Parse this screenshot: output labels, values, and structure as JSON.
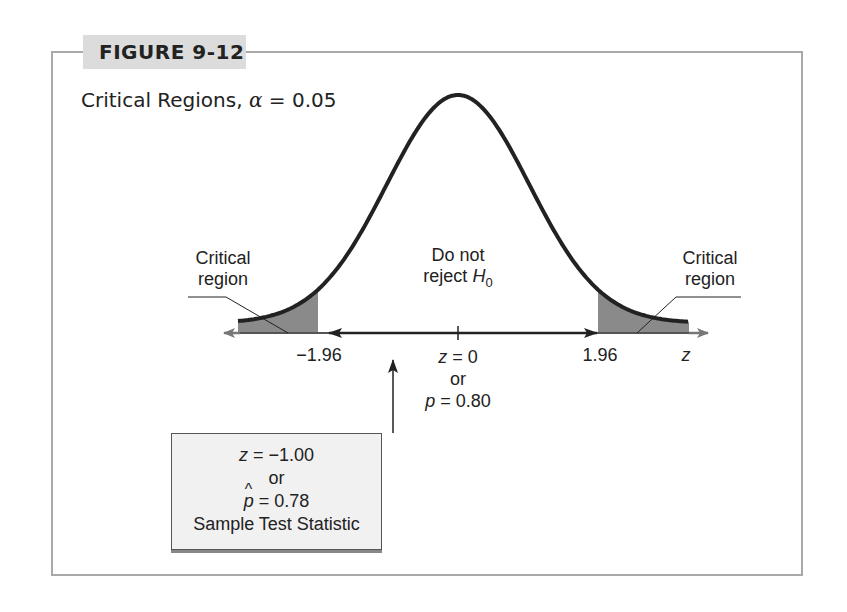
{
  "figure": {
    "label": "FIGURE 9-12",
    "subtitle_prefix": "Critical Regions, ",
    "alpha_symbol": "α",
    "alpha_value": " = 0.05"
  },
  "labels": {
    "left_region_line1": "Critical",
    "left_region_line2": "region",
    "right_region_line1": "Critical",
    "right_region_line2": "region",
    "center_line1": "Do not",
    "center_line2_prefix": "reject ",
    "center_h": "H",
    "center_sub": "0",
    "left_critical": "−1.96",
    "right_critical": "1.96",
    "axis_var": "z",
    "center_z_var": "z",
    "center_z_val": " = 0",
    "center_or": "or",
    "center_p_var": "p",
    "center_p_val": " = 0.80"
  },
  "stat_box": {
    "z_var": "z",
    "z_val": " = −1.00",
    "or": "or",
    "phat_var": "p",
    "phat_val": " = 0.78",
    "caption": "Sample Test Statistic"
  },
  "colors": {
    "frame": "#a9a9a9",
    "label_bg": "#dcdcdc",
    "shade": "#8a8a8a",
    "curve": "#222222",
    "box_bg": "#f1f1f1"
  },
  "chart_data": {
    "type": "area",
    "title": "Critical Regions, α = 0.05",
    "distribution": "standard normal",
    "x_label": "z",
    "critical_values": [
      -1.96,
      1.96
    ],
    "mean": 0,
    "p0": 0.8,
    "rejection_regions": [
      "z < -1.96",
      "z > 1.96"
    ],
    "test_statistic": {
      "z": -1.0,
      "p_hat": 0.78
    },
    "annotations": [
      "Critical region",
      "Do not reject H0",
      "Critical region",
      "Sample Test Statistic"
    ]
  }
}
